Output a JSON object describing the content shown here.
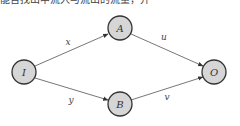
{
  "caption": "能否找出中流入与流出的流量，并",
  "diagram": {
    "nodes": [
      {
        "id": "I",
        "label": "I",
        "cx": 24,
        "cy": 72
      },
      {
        "id": "A",
        "label": "A",
        "cx": 120,
        "cy": 28
      },
      {
        "id": "B",
        "label": "B",
        "cx": 120,
        "cy": 104
      },
      {
        "id": "O",
        "label": "O",
        "cx": 214,
        "cy": 72
      }
    ],
    "edges": [
      {
        "from": "I",
        "to": "A",
        "label": "x"
      },
      {
        "from": "A",
        "to": "O",
        "label": "u"
      },
      {
        "from": "I",
        "to": "B",
        "label": "y"
      },
      {
        "from": "B",
        "to": "O",
        "label": "v"
      }
    ],
    "colors": {
      "node_fill": "#d6d6d6",
      "node_stroke": "#333333",
      "edge": "#666666"
    }
  }
}
